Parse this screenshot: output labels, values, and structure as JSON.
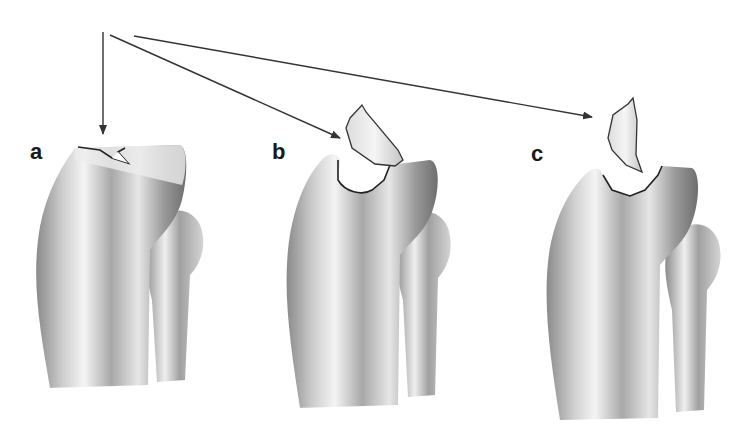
{
  "figure": {
    "panels": [
      {
        "label": "a",
        "description": "tibia with crack at tibial plateau"
      },
      {
        "label": "b",
        "description": "tibia with displaced bone fragment"
      },
      {
        "label": "c",
        "description": "tibia with rotated bone fragment"
      }
    ],
    "arrows": {
      "origin": "shared point at top left",
      "count": 3
    },
    "colors": {
      "ink": "#333333",
      "bone_light": "#f2f2f2",
      "bone_mid": "#bdbdbd",
      "bone_dark": "#777777"
    }
  }
}
